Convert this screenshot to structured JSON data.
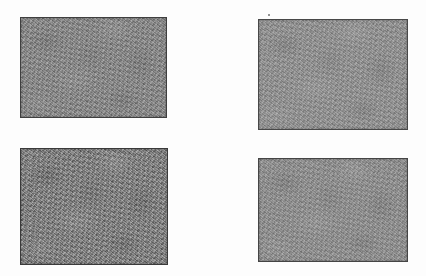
{
  "page": {
    "background_color": "#fdfdfd",
    "width": 426,
    "height": 276
  },
  "plates": [
    {
      "id": "plate-top-left",
      "position": "top-left",
      "x": 20,
      "y": 17,
      "width": 147,
      "height": 101,
      "base_color": "#898989",
      "border_color": "#3f3f3f",
      "texture": "fine mottled film grain",
      "tone": "medium gray, moderate contrast"
    },
    {
      "id": "plate-top-right",
      "position": "top-right",
      "x": 258,
      "y": 19,
      "width": 150,
      "height": 111,
      "base_color": "#949494",
      "border_color": "#484848",
      "texture": "fine mottled film grain",
      "tone": "light gray, low contrast"
    },
    {
      "id": "plate-bottom-left",
      "position": "bottom-left",
      "x": 20,
      "y": 148,
      "width": 148,
      "height": 117,
      "base_color": "#7f7f7f",
      "border_color": "#3a3a3a",
      "texture": "fine mottled film grain",
      "tone": "dark gray, high contrast"
    },
    {
      "id": "plate-bottom-right",
      "position": "bottom-right",
      "x": 258,
      "y": 158,
      "width": 150,
      "height": 104,
      "base_color": "#919191",
      "border_color": "#454545",
      "texture": "fine mottled film grain",
      "tone": "light gray, low contrast"
    }
  ],
  "artifacts": [
    {
      "id": "speck-above-top-right-plate",
      "x": 268,
      "y": 14,
      "size": 2,
      "color": "#6f6f6f"
    }
  ]
}
